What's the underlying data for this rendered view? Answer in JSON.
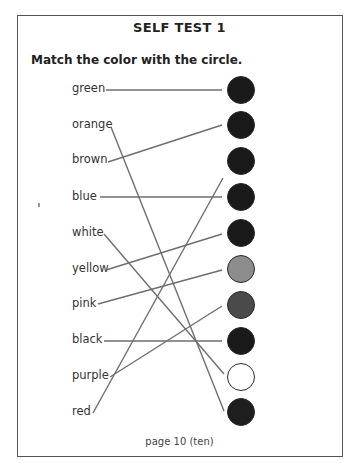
{
  "title": "SELF TEST 1",
  "instruction": "Match the color with the circle.",
  "labels": [
    {
      "text": "green",
      "y": 89
    },
    {
      "text": "orange",
      "y": 125
    },
    {
      "text": "brown",
      "y": 160
    },
    {
      "text": "blue",
      "y": 197
    },
    {
      "text": "white",
      "y": 233
    },
    {
      "text": "yellow",
      "y": 269
    },
    {
      "text": "pink",
      "y": 304
    },
    {
      "text": "black",
      "y": 340
    },
    {
      "text": "purple",
      "y": 376
    },
    {
      "text": "red",
      "y": 412
    }
  ],
  "circles": [
    {
      "cy": 90,
      "fill": "#1a1a1a"
    },
    {
      "cy": 125,
      "fill": "#1a1a1a"
    },
    {
      "cy": 161,
      "fill": "#1a1a1a"
    },
    {
      "cy": 197,
      "fill": "#1a1a1a"
    },
    {
      "cy": 233,
      "fill": "#1a1a1a"
    },
    {
      "cy": 269,
      "fill": "#8c8c8c"
    },
    {
      "cy": 305,
      "fill": "#4a4a4a"
    },
    {
      "cy": 341,
      "fill": "#1a1a1a"
    },
    {
      "cy": 377,
      "fill": "#ffffff"
    },
    {
      "cy": 412,
      "fill": "#1e1e1e"
    }
  ],
  "lines": [
    {
      "from": "green",
      "x1": 106,
      "y1": 90,
      "x2": 222,
      "y2": 90
    },
    {
      "from": "orange",
      "x1": 111,
      "y1": 127,
      "x2": 224,
      "y2": 411
    },
    {
      "from": "brown",
      "x1": 108,
      "y1": 162,
      "x2": 222,
      "y2": 125
    },
    {
      "from": "blue",
      "x1": 100,
      "y1": 197,
      "x2": 222,
      "y2": 197
    },
    {
      "from": "white",
      "x1": 104,
      "y1": 234,
      "x2": 224,
      "y2": 374
    },
    {
      "from": "yellow",
      "x1": 106,
      "y1": 270,
      "x2": 222,
      "y2": 234
    },
    {
      "from": "pink",
      "x1": 98,
      "y1": 304,
      "x2": 222,
      "y2": 270
    },
    {
      "from": "black",
      "x1": 104,
      "y1": 341,
      "x2": 222,
      "y2": 341
    },
    {
      "from": "purple",
      "x1": 110,
      "y1": 377,
      "x2": 222,
      "y2": 306
    },
    {
      "from": "red",
      "x1": 93,
      "y1": 413,
      "x2": 223,
      "y2": 178
    }
  ],
  "footer": "page 10 (ten)",
  "colors": {
    "line": "#6e6e6e",
    "border": "#555555"
  }
}
